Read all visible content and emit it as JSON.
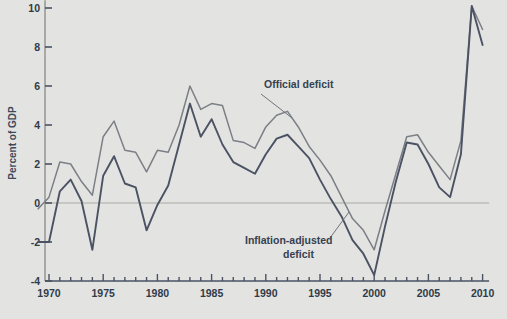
{
  "chart_data": {
    "type": "line",
    "title": "",
    "xlabel": "",
    "ylabel": "Percent of GDP",
    "xlim": [
      1968.6,
      2010.6
    ],
    "ylim": [
      -4,
      10.4
    ],
    "xticks": [
      1970,
      1975,
      1980,
      1985,
      1990,
      1995,
      2000,
      2005,
      2010
    ],
    "xtick_labels": [
      "1970",
      "1975",
      "1980",
      "1985",
      "1990",
      "1995",
      "2000",
      "2005",
      "2010"
    ],
    "yticks": [
      -4,
      -2,
      0,
      2,
      4,
      6,
      8,
      10
    ],
    "ytick_labels": [
      "-4",
      "-2",
      "0",
      "2",
      "4",
      "6",
      "8",
      "10"
    ],
    "minor_xtick_interval": 1,
    "grid": false,
    "zero_line": true,
    "legend_position": "inline-annotations",
    "x": [
      1969,
      1970,
      1971,
      1972,
      1973,
      1974,
      1975,
      1976,
      1977,
      1978,
      1979,
      1980,
      1981,
      1982,
      1983,
      1984,
      1985,
      1986,
      1987,
      1988,
      1989,
      1990,
      1991,
      1992,
      1993,
      1994,
      1995,
      1996,
      1997,
      1998,
      1999,
      2000,
      2001,
      2002,
      2003,
      2004,
      2005,
      2006,
      2007,
      2008,
      2009,
      2010
    ],
    "series": [
      {
        "name": "Official deficit",
        "color": "#7b7f86",
        "values": [
          -0.3,
          0.3,
          2.1,
          2.0,
          1.1,
          0.4,
          3.4,
          4.2,
          2.7,
          2.6,
          1.6,
          2.7,
          2.6,
          4.0,
          6.0,
          4.8,
          5.1,
          5.0,
          3.2,
          3.1,
          2.8,
          3.9,
          4.5,
          4.7,
          3.9,
          2.9,
          2.2,
          1.4,
          0.3,
          -0.8,
          -1.4,
          -2.4,
          -0.4,
          1.5,
          3.4,
          3.5,
          2.6,
          1.9,
          1.2,
          3.2,
          10.1,
          8.9
        ]
      },
      {
        "name": "Inflation-adjusted deficit",
        "color": "#4a5263",
        "values": [
          -2.0,
          -2.0,
          0.6,
          1.2,
          0.1,
          -2.4,
          1.4,
          2.4,
          1.0,
          0.8,
          -1.4,
          -0.1,
          0.9,
          3.0,
          5.1,
          3.4,
          4.3,
          3.0,
          2.1,
          1.8,
          1.5,
          2.5,
          3.3,
          3.5,
          2.9,
          2.3,
          1.2,
          0.2,
          -0.7,
          -1.9,
          -2.6,
          -3.7,
          -1.2,
          1.1,
          3.1,
          3.0,
          2.0,
          0.8,
          0.3,
          2.5,
          10.1,
          8.1
        ]
      }
    ],
    "annotations": [
      {
        "text": "Official deficit",
        "x_px": 264,
        "y_px": 88,
        "leader_from": [
          261,
          94
        ],
        "leader_to": [
          292,
          118
        ]
      },
      {
        "text_line1": "Inflation-adjusted",
        "text_line2": "deficit",
        "x_px": 245,
        "y_px": 244,
        "leader_from": [
          330,
          238
        ],
        "leader_to": [
          349,
          212
        ]
      }
    ]
  },
  "axis": {
    "y_title": "Percent of GDP"
  },
  "annotation_official": "Official deficit",
  "annotation_inflation_line1": "Inflation-adjusted",
  "annotation_inflation_line2": "deficit"
}
